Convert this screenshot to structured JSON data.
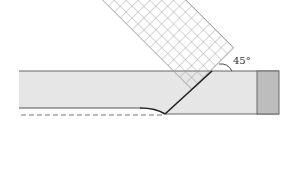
{
  "diagram": {
    "angle_label": "45°",
    "colors": {
      "bar_fill": "#e6e6e6",
      "bar_stroke": "#777777",
      "end_block": "#bdbdbd",
      "grid": "#9a9a9a",
      "crease": "#222222",
      "dashed": "#666666"
    },
    "elements": [
      "horizontal strip",
      "end block",
      "45° grid band",
      "diagonal fold line",
      "curved edge",
      "dashed reference line",
      "angle arc"
    ]
  }
}
